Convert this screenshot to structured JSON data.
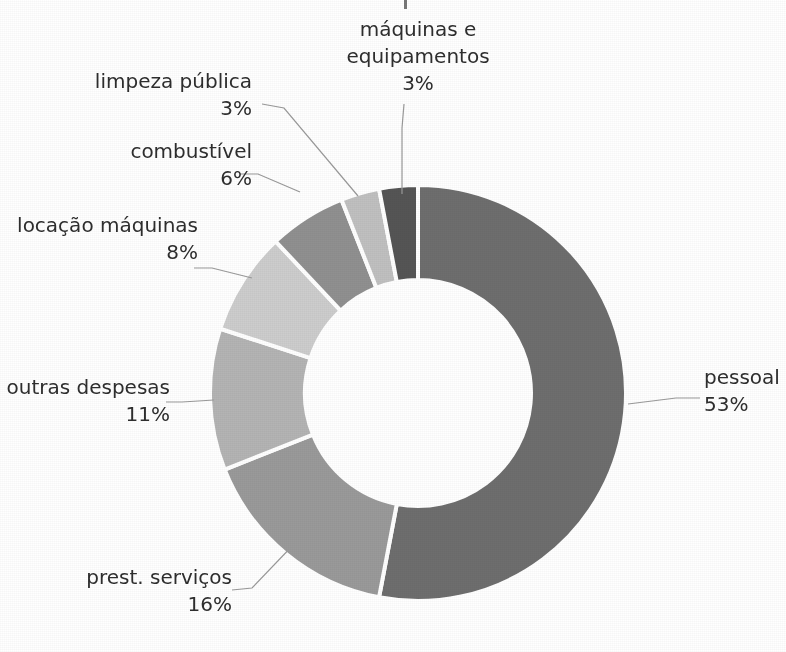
{
  "figure": {
    "title_cut_off": "",
    "background_color": "#ffffff",
    "text_color": "#2e2e2e",
    "leader_line_color": "#9a9a9a",
    "slice_gap_color": "#ffffff"
  },
  "chart_data": {
    "type": "pie",
    "variant": "donut",
    "title": "",
    "subtitle": "",
    "xlabel": "",
    "ylabel": "",
    "legend_position": "none",
    "labels_position": "outside-with-leader-lines",
    "grid": false,
    "start_angle_deg": 0,
    "direction": "clockwise",
    "inner_radius_ratio": 0.545,
    "units": "%",
    "total": 100,
    "categories": [
      "pessoal",
      "prest. serviços",
      "outras despesas",
      "locação máquinas",
      "combustível",
      "limpeza pública",
      "máquinas e equipamentos"
    ],
    "values": [
      53,
      16,
      11,
      8,
      6,
      3,
      3
    ],
    "colors": [
      "#6e6e6e",
      "#9a9a9a",
      "#b4b4b4",
      "#cdcdcd",
      "#909090",
      "#c0c0c0",
      "#555555"
    ],
    "slices": [
      {
        "label": "pessoal",
        "value": 53,
        "value_text": "53%",
        "color": "#6e6e6e",
        "label_line1": "pessoal",
        "label_line2": "53%",
        "label_x": 704,
        "label_y": 384,
        "label_anchor": "start",
        "leader": "M 628,404 L 676,398 L 700,398"
      },
      {
        "label": "prest. serviços",
        "value": 16,
        "value_text": "16%",
        "color": "#9a9a9a",
        "label_line1": "prest. serviços",
        "label_line2": "16%",
        "label_x": 232,
        "label_y": 584,
        "label_anchor": "end",
        "leader": "M 296,542 L 252,588 L 232,590"
      },
      {
        "label": "outras despesas",
        "value": 11,
        "value_text": "11%",
        "color": "#b4b4b4",
        "label_line1": "outras despesas",
        "label_line2": "11%",
        "label_x": 170,
        "label_y": 394,
        "label_anchor": "end",
        "leader": "M 214,400 L 182,402 L 166,402"
      },
      {
        "label": "locação máquinas",
        "value": 8,
        "value_text": "8%",
        "color": "#cdcdcd",
        "label_line1": "locação máquinas",
        "label_line2": "8%",
        "label_x": 198,
        "label_y": 232,
        "label_anchor": "end",
        "leader": "M 252,278 L 212,268 L 194,268"
      },
      {
        "label": "combustível",
        "value": 6,
        "value_text": "6%",
        "color": "#909090",
        "label_line1": "combustível",
        "label_line2": "6%",
        "label_x": 252,
        "label_y": 158,
        "label_anchor": "end",
        "leader": "M 300,192 L 258,174 L 240,174"
      },
      {
        "label": "limpeza pública",
        "value": 3,
        "value_text": "3%",
        "color": "#c0c0c0",
        "label_line1": "limpeza pública",
        "label_line2": "3%",
        "label_x": 252,
        "label_y": 88,
        "label_anchor": "end",
        "leader": "M 358,196 L 284,108 L 262,104"
      },
      {
        "label": "máquinas e equipamentos",
        "value": 3,
        "value_text": "3%",
        "color": "#555555",
        "label_line1": "máquinas e",
        "label_line2": "equipamentos",
        "label_line3": "3%",
        "label_x": 418,
        "label_y": 36,
        "label_anchor": "middle",
        "leader": "M 402,194 L 402,128 L 404,104"
      }
    ]
  },
  "geometry": {
    "center_x": 418,
    "center_y": 393,
    "outer_radius": 208,
    "inner_radius": 113
  }
}
